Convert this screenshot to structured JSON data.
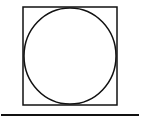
{
  "diagram": {
    "colors": {
      "stroke": "#111111",
      "background": "#ffffff"
    },
    "square": {
      "x": 23,
      "y": 7,
      "width": 94,
      "height": 98
    },
    "circle": {
      "cx": 70,
      "cy": 56,
      "rx": 46,
      "ry": 48
    },
    "line": {
      "x1": 1,
      "y1": 115,
      "x2": 139,
      "y2": 115
    }
  }
}
